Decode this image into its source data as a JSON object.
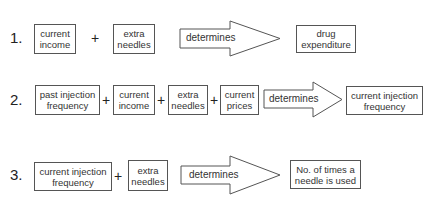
{
  "diagram": {
    "type": "relationship-equations",
    "rows": [
      {
        "number": "1.",
        "inputs": [
          "current income",
          "extra needles"
        ],
        "operator": "+",
        "relation": "determines",
        "output": "drug expenditure"
      },
      {
        "number": "2.",
        "inputs": [
          "past injection frequency",
          "current income",
          "extra needles",
          "current prices"
        ],
        "operator": "+",
        "relation": "determines",
        "output": "current injection frequency"
      },
      {
        "number": "3.",
        "inputs": [
          "current injection frequency",
          "extra needles"
        ],
        "operator": "+",
        "relation": "determines",
        "output": "No. of times a needle is used"
      }
    ],
    "colors": {
      "stroke": "#555555",
      "text": "#333333",
      "background": "#ffffff"
    }
  }
}
